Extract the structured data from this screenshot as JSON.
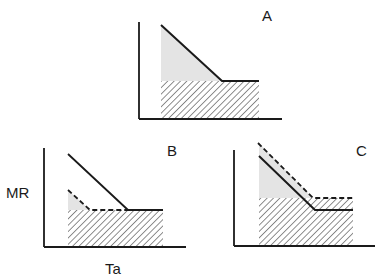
{
  "figure": {
    "colors": {
      "line": "#1a1a1a",
      "shade": "#e4e4e4",
      "hatch": "#333333",
      "background": "#ffffff"
    },
    "axis_labels": {
      "y": "MR",
      "x": "Ta"
    },
    "panels": [
      {
        "id": "A",
        "label": "A",
        "curves": [
          {
            "style": "solid",
            "description": "metabolic rate: decreasing below thermoneutral zone, then flat"
          }
        ],
        "regions": [
          "shaded thermoregulatory cost (triangle)",
          "hatched basal metabolism (rectangle)"
        ]
      },
      {
        "id": "B",
        "label": "B",
        "curves": [
          {
            "style": "solid",
            "description": "original metabolic rate curve"
          },
          {
            "style": "dashed",
            "description": "reduced metabolic rate curve (lower costs)"
          }
        ],
        "regions": [
          "small shaded triangle",
          "hatched basal rectangle"
        ]
      },
      {
        "id": "C",
        "label": "C",
        "curves": [
          {
            "style": "solid",
            "description": "original metabolic rate curve"
          },
          {
            "style": "dashed",
            "description": "elevated metabolic rate curve (higher basal)"
          }
        ],
        "regions": [
          "shaded thermoregulatory triangle",
          "taller hatched basal rectangle"
        ]
      }
    ]
  }
}
